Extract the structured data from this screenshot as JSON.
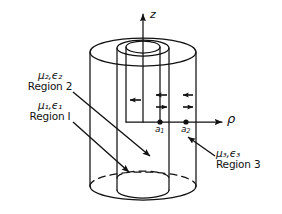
{
  "figure": {
    "kind": "coaxial-cylinder-cross-section-diagram",
    "axes": {
      "vertical": {
        "label": "z",
        "name": "z-axis"
      },
      "horizontal": {
        "label": "ρ",
        "name": "rho-axis"
      }
    },
    "radii": [
      {
        "label": "a",
        "sub": "1",
        "name": "inner-radius-a1"
      },
      {
        "label": "a",
        "sub": "2",
        "name": "outer-radius-a2"
      }
    ],
    "regions": [
      {
        "id": "region-1",
        "material": "μ",
        "material_sub": "1",
        "permittivity": "ϵ",
        "permittivity_sub": "1",
        "material_line": "μ₁,ϵ₁",
        "name_line": "Region I"
      },
      {
        "id": "region-2",
        "material": "μ",
        "material_sub": "2",
        "permittivity": "ϵ",
        "permittivity_sub": "2",
        "material_line": "μ₂,ϵ₂",
        "name_line": "Region 2"
      },
      {
        "id": "region-3",
        "material": "μ",
        "material_sub": "3",
        "permittivity": "ϵ",
        "permittivity_sub": "3",
        "material_line": "μ₃,ϵ₃",
        "name_line": "Region 3"
      }
    ],
    "field_arrows": {
      "region1": [
        "left"
      ],
      "region2": [
        "left",
        "right"
      ],
      "region3": [
        "left",
        "right"
      ]
    },
    "colors": {
      "stroke": "#111111",
      "background": "#ffffff"
    }
  }
}
